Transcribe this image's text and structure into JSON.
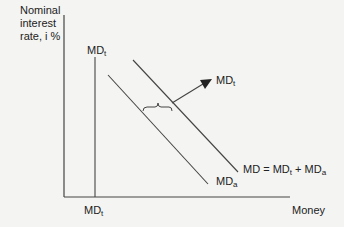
{
  "diagram": {
    "y_axis_label_line1": "Nominal",
    "y_axis_label_line2": "interest",
    "y_axis_label_line3": "rate, i %",
    "x_axis_label": "Money",
    "labels": {
      "md_t_top": "MD",
      "md_t_top_sub": "t",
      "md_t_bottom": "MD",
      "md_t_bottom_sub": "t",
      "md_t_arrow": "MD",
      "md_t_arrow_sub": "t",
      "md_a": "MD",
      "md_a_sub": "a",
      "md_total_prefix": "MD = MD",
      "md_total_sub1": "t",
      "md_total_mid": " + MD",
      "md_total_sub2": "a"
    },
    "colors": {
      "line": "#333333",
      "background": "#f4f4f2"
    }
  }
}
